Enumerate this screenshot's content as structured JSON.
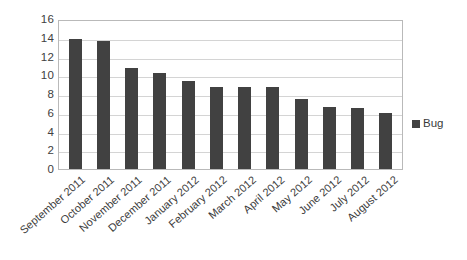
{
  "chart_data": {
    "type": "bar",
    "title": "",
    "subtitle": "",
    "xlabel": "",
    "ylabel": "",
    "ylim": [
      0,
      16
    ],
    "yticks": [
      16,
      14,
      12,
      10,
      8,
      6,
      4,
      2,
      0
    ],
    "grid": true,
    "legend_position": "right",
    "categories": [
      "September 2011",
      "October 2011",
      "November 2011",
      "December 2011",
      "January 2012",
      "February 2012",
      "March 2012",
      "April 2012",
      "May 2012",
      "June 2012",
      "July 2012",
      "August 2012"
    ],
    "series": [
      {
        "name": "Bug",
        "color": "#414141",
        "values": [
          13.9,
          13.7,
          10.8,
          10.2,
          9.4,
          8.7,
          8.7,
          8.8,
          7.5,
          6.6,
          6.5,
          6.0
        ]
      }
    ]
  },
  "legend": {
    "items": [
      {
        "label": "Bug",
        "swatch_name": "legend-swatch-bug"
      }
    ]
  },
  "colors": {
    "bar": "#414141",
    "gridline": "#d4d4d4",
    "plot_border": "#b9b9b9",
    "text": "#3a3a3a",
    "background": "#ffffff"
  }
}
